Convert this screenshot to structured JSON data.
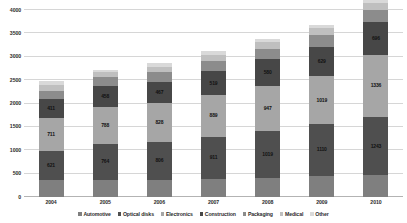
{
  "chart_data": {
    "type": "bar",
    "stacked": true,
    "title": "",
    "subtitle": "",
    "xlabel": "",
    "ylabel": "",
    "ylim": [
      0,
      4000
    ],
    "ytick_step": 500,
    "yticks": [
      0,
      500,
      1000,
      1500,
      2000,
      2500,
      3000,
      3500,
      4000
    ],
    "ytick_labels": [
      "0",
      "500",
      "1000",
      "1500",
      "2000",
      "2500",
      "3000",
      "3500",
      "4000"
    ],
    "grid": true,
    "legend_position": "bottom",
    "categories": [
      "2004",
      "2005",
      "2006",
      "2007",
      "2008",
      "2009",
      "2010"
    ],
    "series": [
      {
        "name": "Automotive",
        "color": "#7f7f7f",
        "values": [
          355,
          370,
          370,
          380,
          400,
          455,
          465
        ],
        "labels": [
          "",
          "",
          "",
          "",
          "",
          "",
          ""
        ]
      },
      {
        "name": "Optical disks",
        "color": "#4f4f4f",
        "values": [
          621,
          764,
          806,
          911,
          1019,
          1110,
          1243
        ],
        "labels": [
          "621",
          "764",
          "806",
          "911",
          "1019",
          "1110",
          "1243"
        ]
      },
      {
        "name": "Electronics",
        "color": "#a6a6a6",
        "values": [
          711,
          788,
          828,
          889,
          947,
          1019,
          1336
        ],
        "labels": [
          "711",
          "788",
          "828",
          "889",
          "947",
          "1019",
          "1336"
        ]
      },
      {
        "name": "Construction",
        "color": "#474747",
        "values": [
          411,
          458,
          467,
          519,
          580,
          629,
          696
        ],
        "labels": [
          "411",
          "458",
          "467",
          "519",
          "580",
          "629",
          "696"
        ]
      },
      {
        "name": "Packaging",
        "color": "#8c8c8c",
        "values": [
          180,
          190,
          200,
          215,
          230,
          245,
          260
        ],
        "labels": [
          "",
          "",
          "",
          "",
          "",
          "",
          ""
        ]
      },
      {
        "name": "Medical",
        "color": "#bfbfbf",
        "values": [
          110,
          115,
          120,
          130,
          140,
          150,
          160
        ],
        "labels": [
          "",
          "",
          "",
          "",
          "",
          "",
          ""
        ]
      },
      {
        "name": "Other",
        "color": "#d9d9d9",
        "values": [
          90,
          40,
          85,
          80,
          75,
          75,
          70
        ],
        "labels": [
          "",
          "",
          "",
          "",
          "",
          "",
          ""
        ]
      }
    ],
    "totals": [
      2478,
      2725,
      2876,
      3124,
      3391,
      3683,
      4230
    ]
  }
}
